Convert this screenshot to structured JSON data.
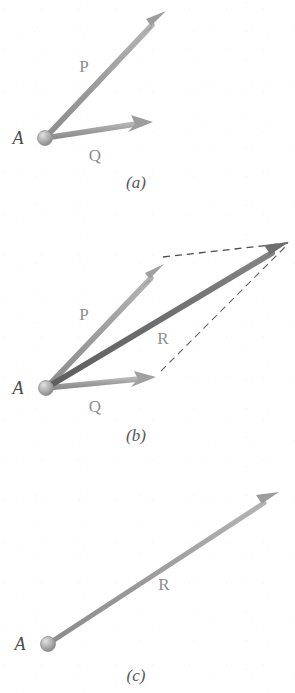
{
  "figure": {
    "background_color": "#ffffff",
    "panels": [
      {
        "id": "a",
        "caption": "(a)",
        "caption_pos": {
          "x": 136,
          "y": 188
        },
        "origin_label": "A",
        "origin_label_pos": {
          "x": 18,
          "y": 144
        },
        "origin_point": {
          "x": 45,
          "y": 138
        },
        "vectors": [
          {
            "name": "P",
            "label": "P",
            "label_pos": {
              "x": 84,
              "y": 72
            },
            "color": "#9d9d9d",
            "width": 5.5,
            "from": {
              "x": 45,
              "y": 138
            },
            "to": {
              "x": 166,
              "y": 11
            },
            "style": "solid",
            "arrowhead": true
          },
          {
            "name": "Q",
            "label": "Q",
            "label_pos": {
              "x": 95,
              "y": 161
            },
            "color": "#9d9d9d",
            "width": 5.5,
            "from": {
              "x": 45,
              "y": 138
            },
            "to": {
              "x": 153,
              "y": 122
            },
            "style": "solid",
            "arrowhead": true
          }
        ]
      },
      {
        "id": "b",
        "caption": "(b)",
        "caption_pos": {
          "x": 136,
          "y": 441
        },
        "origin_label": "A",
        "origin_label_pos": {
          "x": 18,
          "y": 394
        },
        "origin_point": {
          "x": 46,
          "y": 388
        },
        "vectors": [
          {
            "name": "P",
            "label": "P",
            "label_pos": {
              "x": 84,
              "y": 320
            },
            "color": "#a0a0a0",
            "width": 5.5,
            "from": {
              "x": 46,
              "y": 388
            },
            "to": {
              "x": 164,
              "y": 264
            },
            "style": "solid",
            "arrowhead": true
          },
          {
            "name": "Q",
            "label": "Q",
            "label_pos": {
              "x": 95,
              "y": 412
            },
            "color": "#a0a0a0",
            "width": 5.5,
            "from": {
              "x": 46,
              "y": 388
            },
            "to": {
              "x": 156,
              "y": 377
            },
            "style": "solid",
            "arrowhead": true
          },
          {
            "name": "R",
            "label": "R",
            "label_pos": {
              "x": 163,
              "y": 344
            },
            "color": "#6e6e6e",
            "width": 6,
            "from": {
              "x": 46,
              "y": 388
            },
            "to": {
              "x": 289,
              "y": 242
            },
            "style": "solid",
            "arrowhead": true
          }
        ],
        "construction_lines": [
          {
            "name": "dashed-top",
            "from": {
              "x": 163,
              "y": 257
            },
            "to": {
              "x": 288,
              "y": 243
            },
            "color": "#4d4d4d",
            "width": 1.3,
            "dash": "7 5"
          },
          {
            "name": "dashed-right",
            "from": {
              "x": 161,
              "y": 371
            },
            "to": {
              "x": 288,
              "y": 244
            },
            "color": "#6b6b6b",
            "width": 1.2,
            "dash": "7 5"
          }
        ]
      },
      {
        "id": "c",
        "caption": "(c)",
        "caption_pos": {
          "x": 136,
          "y": 681
        },
        "origin_label": "A",
        "origin_label_pos": {
          "x": 20,
          "y": 650
        },
        "origin_point": {
          "x": 48,
          "y": 644
        },
        "vectors": [
          {
            "name": "R",
            "label": "R",
            "label_pos": {
              "x": 164,
              "y": 590
            },
            "color": "#9d9d9d",
            "width": 5,
            "from": {
              "x": 48,
              "y": 644
            },
            "to": {
              "x": 279,
              "y": 492
            },
            "style": "solid",
            "arrowhead": true
          }
        ]
      }
    ],
    "origin_dot": {
      "name": "pivot-dot",
      "radius": 7,
      "fill": "#a8a8a8",
      "highlight": "#d4d4d4",
      "stroke": "#8a8a8a"
    }
  }
}
